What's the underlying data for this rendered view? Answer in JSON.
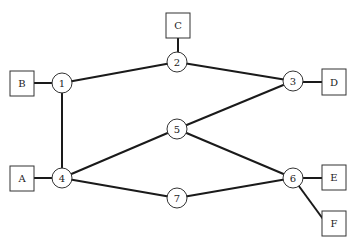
{
  "diagram": {
    "type": "network-graph",
    "colors": {
      "stroke": "#1a1a1a",
      "node_stroke": "#333333",
      "background": "#ffffff"
    },
    "nodes": [
      {
        "id": "1",
        "label": "1",
        "shape": "circle",
        "x": 62,
        "y": 83
      },
      {
        "id": "2",
        "label": "2",
        "shape": "circle",
        "x": 177,
        "y": 62
      },
      {
        "id": "3",
        "label": "3",
        "shape": "circle",
        "x": 293,
        "y": 81
      },
      {
        "id": "4",
        "label": "4",
        "shape": "circle",
        "x": 62,
        "y": 178
      },
      {
        "id": "5",
        "label": "5",
        "shape": "circle",
        "x": 177,
        "y": 129
      },
      {
        "id": "6",
        "label": "6",
        "shape": "circle",
        "x": 293,
        "y": 178
      },
      {
        "id": "7",
        "label": "7",
        "shape": "circle",
        "x": 177,
        "y": 198
      }
    ],
    "terminals": [
      {
        "id": "A",
        "label": "A",
        "shape": "square",
        "x": 22,
        "y": 178,
        "attached_to": "4"
      },
      {
        "id": "B",
        "label": "B",
        "shape": "square",
        "x": 22,
        "y": 83,
        "attached_to": "1"
      },
      {
        "id": "C",
        "label": "C",
        "shape": "square",
        "x": 178,
        "y": 25,
        "attached_to": "2"
      },
      {
        "id": "D",
        "label": "D",
        "shape": "square",
        "x": 334,
        "y": 82,
        "attached_to": "3"
      },
      {
        "id": "E",
        "label": "E",
        "shape": "square",
        "x": 334,
        "y": 177,
        "attached_to": "6"
      },
      {
        "id": "F",
        "label": "F",
        "shape": "square",
        "x": 334,
        "y": 223,
        "attached_to": "6"
      }
    ],
    "edges": [
      [
        "1",
        "2"
      ],
      [
        "2",
        "3"
      ],
      [
        "1",
        "4"
      ],
      [
        "3",
        "5"
      ],
      [
        "4",
        "5"
      ],
      [
        "5",
        "6"
      ],
      [
        "4",
        "7"
      ],
      [
        "7",
        "6"
      ],
      [
        "B",
        "1"
      ],
      [
        "C",
        "2"
      ],
      [
        "D",
        "3"
      ],
      [
        "A",
        "4"
      ],
      [
        "E",
        "6"
      ],
      [
        "F",
        "6"
      ]
    ]
  }
}
